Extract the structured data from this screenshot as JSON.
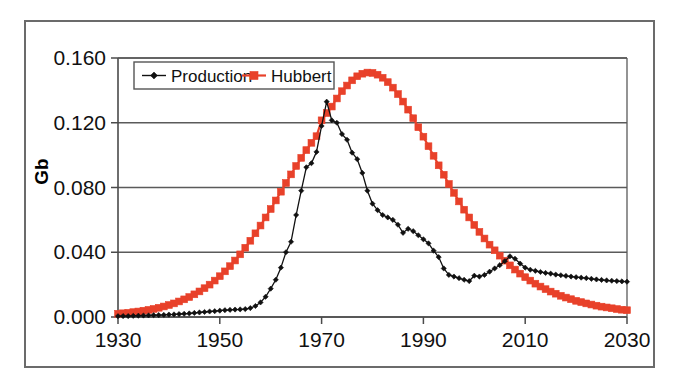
{
  "chart_data": {
    "type": "line",
    "title": "",
    "subtitle": "",
    "xlabel": "",
    "ylabel": "Gb",
    "xlim": [
      1930,
      2030
    ],
    "ylim": [
      0.0,
      0.16
    ],
    "grid": true,
    "legend_position": "top-left",
    "x_ticks": [
      "1930",
      "1950",
      "1970",
      "1990",
      "2010",
      "2030"
    ],
    "x_tick_values": [
      1930,
      1950,
      1970,
      1990,
      2010,
      2030
    ],
    "y_ticks": [
      "0.000",
      "0.040",
      "0.080",
      "0.120",
      "0.160"
    ],
    "y_tick_values": [
      0.0,
      0.04,
      0.08,
      0.12,
      0.16
    ],
    "x": [
      1930,
      1931,
      1932,
      1933,
      1934,
      1935,
      1936,
      1937,
      1938,
      1939,
      1940,
      1941,
      1942,
      1943,
      1944,
      1945,
      1946,
      1947,
      1948,
      1949,
      1950,
      1951,
      1952,
      1953,
      1954,
      1955,
      1956,
      1957,
      1958,
      1959,
      1960,
      1961,
      1962,
      1963,
      1964,
      1965,
      1966,
      1967,
      1968,
      1969,
      1970,
      1971,
      1972,
      1973,
      1974,
      1975,
      1976,
      1977,
      1978,
      1979,
      1980,
      1981,
      1982,
      1983,
      1984,
      1985,
      1986,
      1987,
      1988,
      1989,
      1990,
      1991,
      1992,
      1993,
      1994,
      1995,
      1996,
      1997,
      1998,
      1999,
      2000,
      2001,
      2002,
      2003,
      2004,
      2005,
      2006,
      2007,
      2008,
      2009,
      2010,
      2011,
      2012,
      2013,
      2014,
      2015,
      2016,
      2017,
      2018,
      2019,
      2020,
      2021,
      2022,
      2023,
      2024,
      2025,
      2026,
      2027,
      2028,
      2029,
      2030
    ],
    "series": [
      {
        "name": "Production",
        "color": "#111111",
        "marker": "diamond",
        "values": [
          0.0005,
          0.0006,
          0.0006,
          0.0007,
          0.0008,
          0.0009,
          0.001,
          0.0011,
          0.0012,
          0.0013,
          0.0015,
          0.0016,
          0.0018,
          0.002,
          0.0022,
          0.0025,
          0.0028,
          0.0031,
          0.0034,
          0.0036,
          0.0039,
          0.0042,
          0.0044,
          0.0046,
          0.0047,
          0.0049,
          0.0055,
          0.0068,
          0.009,
          0.0125,
          0.0175,
          0.023,
          0.0305,
          0.04,
          0.0465,
          0.063,
          0.078,
          0.0925,
          0.095,
          0.102,
          0.118,
          0.133,
          0.1215,
          0.12,
          0.113,
          0.1095,
          0.1015,
          0.0975,
          0.089,
          0.078,
          0.07,
          0.066,
          0.063,
          0.0615,
          0.06,
          0.057,
          0.052,
          0.0545,
          0.053,
          0.0505,
          0.048,
          0.0455,
          0.041,
          0.037,
          0.03,
          0.026,
          0.025,
          0.024,
          0.023,
          0.0222,
          0.0255,
          0.025,
          0.026,
          0.028,
          0.03,
          0.032,
          0.0345,
          0.0375,
          0.036,
          0.033,
          0.0305,
          0.0292,
          0.0285,
          0.0278,
          0.0272,
          0.0268,
          0.0262,
          0.0258,
          0.0254,
          0.025,
          0.0246,
          0.0243,
          0.024,
          0.0236,
          0.0232,
          0.0229,
          0.0226,
          0.0224,
          0.0222,
          0.022,
          0.0218
        ]
      },
      {
        "name": "Hubbert",
        "color": "#E8412A",
        "marker": "square",
        "values": [
          0.002,
          0.0023,
          0.0026,
          0.003,
          0.0034,
          0.0039,
          0.0044,
          0.005,
          0.0057,
          0.0065,
          0.0074,
          0.0084,
          0.0096,
          0.0109,
          0.0123,
          0.014,
          0.0158,
          0.0178,
          0.02,
          0.0225,
          0.0252,
          0.0282,
          0.0314,
          0.0349,
          0.0387,
          0.0428,
          0.0471,
          0.0517,
          0.0565,
          0.0615,
          0.0667,
          0.072,
          0.0774,
          0.0828,
          0.0881,
          0.0933,
          0.0983,
          0.1031,
          0.1076,
          0.1117,
          0.1215,
          0.126,
          0.13,
          0.135,
          0.1395,
          0.143,
          0.1462,
          0.1487,
          0.1503,
          0.151,
          0.1508,
          0.1497,
          0.1478,
          0.1451,
          0.1417,
          0.1377,
          0.1331,
          0.1281,
          0.1228,
          0.1172,
          0.1114,
          0.1055,
          0.0996,
          0.0937,
          0.0879,
          0.0822,
          0.0767,
          0.0714,
          0.0663,
          0.0615,
          0.0569,
          0.0526,
          0.0485,
          0.0447,
          0.0412,
          0.0379,
          0.0348,
          0.0319,
          0.0293,
          0.0268,
          0.0246,
          0.0225,
          0.0206,
          0.0188,
          0.0172,
          0.0157,
          0.0144,
          0.0131,
          0.012,
          0.011,
          0.01,
          0.0092,
          0.0084,
          0.0077,
          0.007,
          0.0064,
          0.0059,
          0.0054,
          0.0049,
          0.0045,
          0.0042
        ]
      }
    ]
  },
  "legend": {
    "items": [
      {
        "label": "Production",
        "color": "#111111",
        "marker": "diamond"
      },
      {
        "label": "Hubbert",
        "color": "#E8412A",
        "marker": "square"
      }
    ]
  },
  "axes": {
    "y_axis_title": "Gb"
  }
}
